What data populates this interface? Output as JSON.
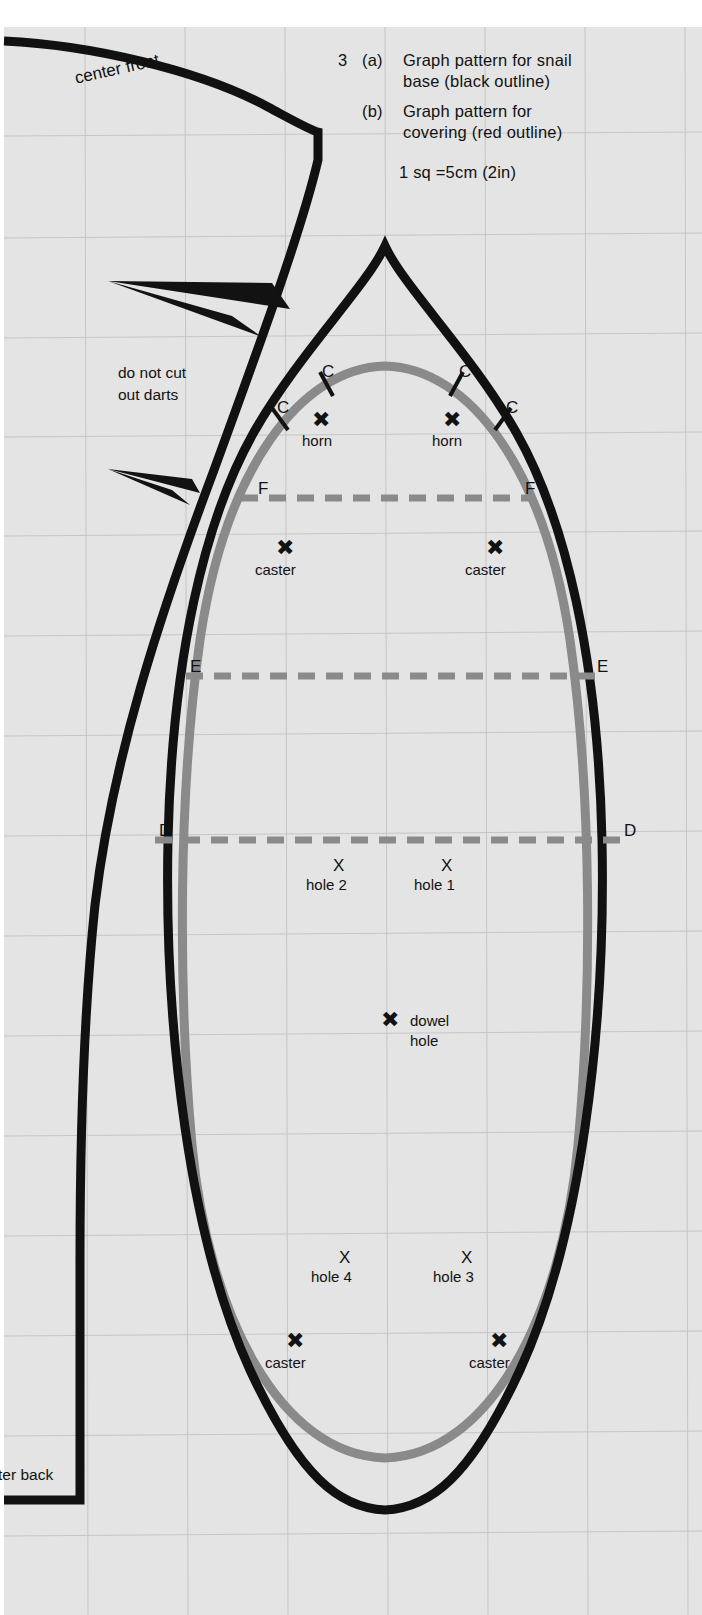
{
  "figure": {
    "background_color": "#e3e4e3",
    "paper_color": "#ffffff",
    "outline_black": "#111111",
    "outline_gray": "#8a8a8a",
    "grid_color": "#c3c4c3"
  },
  "caption": {
    "number": "3",
    "a_marker": "(a)",
    "a_line1": "Graph pattern for snail",
    "a_line2": "base (black outline)",
    "b_marker": "(b)",
    "b_line1": "Graph pattern for",
    "b_line2": "covering (red outline)",
    "scale": "1 sq =5cm (2in)"
  },
  "edge_labels": {
    "center_front": "center front",
    "center_back": "ter back"
  },
  "notes": {
    "darts_line1": "do not cut",
    "darts_line2": "out darts"
  },
  "notch_labels": {
    "c_outer_left": "C",
    "c_inner_left": "C",
    "c_inner_right": "C",
    "c_outer_right": "C"
  },
  "guide_lines": [
    {
      "id": "F",
      "left_label": "F",
      "right_label": "F"
    },
    {
      "id": "E",
      "left_label": "E",
      "right_label": "E"
    },
    {
      "id": "D",
      "left_label": "D",
      "right_label": "D"
    }
  ],
  "markers": {
    "horn_left": {
      "glyph": "✖",
      "label": "horn"
    },
    "horn_right": {
      "glyph": "✖",
      "label": "horn"
    },
    "caster_upper_left": {
      "glyph": "✖",
      "label": "caster"
    },
    "caster_upper_right": {
      "glyph": "✖",
      "label": "caster"
    },
    "hole_2": {
      "glyph": "X",
      "label": "hole 2"
    },
    "hole_1": {
      "glyph": "X",
      "label": "hole 1"
    },
    "dowel": {
      "glyph": "✖",
      "label_line1": "dowel",
      "label_line2": "hole"
    },
    "hole_4": {
      "glyph": "X",
      "label": "hole 4"
    },
    "hole_3": {
      "glyph": "X",
      "label": "hole 3"
    },
    "caster_lower_left": {
      "glyph": "✖",
      "label": "caster"
    },
    "caster_lower_right": {
      "glyph": "✖",
      "label": "caster"
    }
  }
}
